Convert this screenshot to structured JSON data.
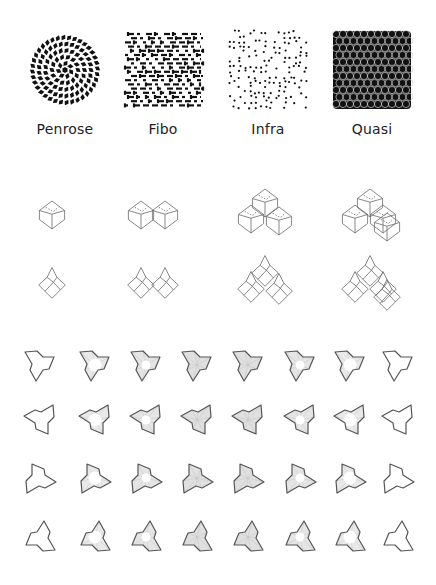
{
  "figure": {
    "tilings": [
      {
        "label": "Penrose",
        "kind": "penrose",
        "cx": 65,
        "cy": 70
      },
      {
        "label": "Fibo",
        "kind": "fibo",
        "cx": 163,
        "cy": 70
      },
      {
        "label": "Infra",
        "kind": "infra",
        "cx": 268,
        "cy": 70
      },
      {
        "label": "Quasi",
        "kind": "quasi",
        "cx": 372,
        "cy": 70
      }
    ],
    "label_y": 130,
    "cluster_rows": [
      {
        "name": "3d-clusters",
        "y": 215,
        "sizes": [
          1,
          2,
          3,
          4
        ]
      },
      {
        "name": "2d-clusters",
        "y": 285,
        "sizes": [
          1,
          2,
          3,
          4
        ]
      }
    ],
    "cluster_columns_x": [
      52,
      153,
      265,
      370
    ],
    "tile_rows": [
      {
        "orientation": "down-left-notch",
        "y": 365,
        "rotation": 0
      },
      {
        "orientation": "chevron-right",
        "y": 420,
        "rotation": 90
      },
      {
        "orientation": "chevron-left",
        "y": 478,
        "rotation": 270
      },
      {
        "orientation": "triangle-down",
        "y": 537,
        "rotation": 180
      }
    ],
    "tile_columns_x": [
      40,
      95,
      146,
      197,
      248,
      300,
      350,
      398
    ],
    "tile_fill_levels": [
      0,
      0.45,
      0.65,
      0.9,
      0.9,
      0.65,
      0.45,
      0
    ],
    "colors": {
      "ink": "#111111",
      "line": "#6a6a6a",
      "tile_outline": "#555555",
      "tile_fill": "#d8d8d8",
      "text": "#222222"
    }
  }
}
